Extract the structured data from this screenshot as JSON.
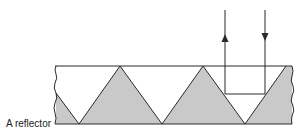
{
  "diagram": {
    "label": "A reflector",
    "colors": {
      "fill": "#c9c9c9",
      "stroke": "#2a2a2a",
      "background": "#ffffff"
    },
    "elements": [
      {
        "type": "reflector-body",
        "description": "strip with triangular (corner-cube) prism profile"
      },
      {
        "type": "incoming-ray",
        "direction": "down"
      },
      {
        "type": "outgoing-ray",
        "direction": "up"
      }
    ]
  }
}
